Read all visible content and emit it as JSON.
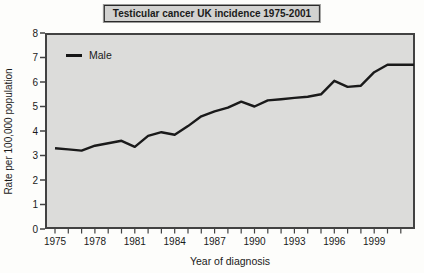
{
  "chart": {
    "title": "Testicular cancer UK incidence 1975-2001",
    "ylabel": "Rate per 100,000 population",
    "xlabel": "Year of diagnosis",
    "legend": [
      "Male"
    ]
  },
  "chart_data": {
    "type": "line",
    "title": "Testicular cancer UK incidence 1975-2001",
    "xlabel": "Year of diagnosis",
    "ylabel": "Rate per 100,000 population",
    "grid": false,
    "legend_position": "top-left",
    "ylim": [
      0,
      8
    ],
    "y_ticks": [
      0,
      1,
      2,
      3,
      4,
      5,
      6,
      7,
      8
    ],
    "x_major_tick_labels": [
      1975,
      1978,
      1981,
      1984,
      1987,
      1990,
      1993,
      1996,
      1999
    ],
    "x_range": [
      1975,
      2001
    ],
    "series": [
      {
        "name": "Male",
        "color": "#1a1a1a",
        "x": [
          1975,
          1976,
          1977,
          1978,
          1979,
          1980,
          1981,
          1982,
          1983,
          1984,
          1985,
          1986,
          1987,
          1988,
          1989,
          1990,
          1991,
          1992,
          1993,
          1994,
          1995,
          1996,
          1997,
          1998,
          1999,
          2000,
          2001
        ],
        "values": [
          3.3,
          3.25,
          3.2,
          3.4,
          3.5,
          3.6,
          3.35,
          3.8,
          3.95,
          3.85,
          4.2,
          4.6,
          4.8,
          4.95,
          5.2,
          5.0,
          5.25,
          5.3,
          5.35,
          5.4,
          5.5,
          6.05,
          5.8,
          5.85,
          6.4,
          6.7,
          6.7
        ]
      }
    ]
  },
  "colors": {
    "plot_background": "#dcdcda",
    "figure_background": "#fdfdfb",
    "title_box_background": "#d2d2d0",
    "axis": "#424242",
    "line": "#1a1a1a"
  }
}
